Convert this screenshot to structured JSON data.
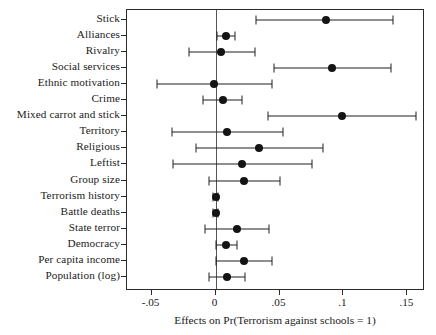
{
  "chart_data": {
    "type": "scatter",
    "title": "",
    "subtitle": "",
    "xlabel": "Effects on Pr(Terrorism against schools = 1)",
    "ylabel": "",
    "xlim": [
      -0.0692,
      0.1637
    ],
    "xticks": [
      -0.05,
      0,
      0.05,
      0.1,
      0.15
    ],
    "xtick_labels": [
      "-.05",
      "0",
      ".05",
      ".1",
      ".15"
    ],
    "grid": false,
    "legend": null,
    "reference_line": 0,
    "orientation": "horizontal",
    "marker": "filled-circle",
    "error_bars": "confidence-interval",
    "categories": [
      "Stick",
      "Alliances",
      "Rivalry",
      "Social services",
      "Ethnic motivation",
      "Crime",
      "Mixed carrot and stick",
      "Territory",
      "Religious",
      "Leftist",
      "Group size",
      "Terrorism history",
      "Battle deaths",
      "State terror",
      "Democracy",
      "Per capita income",
      "Population (log)"
    ],
    "values": [
      0.086,
      0.008,
      0.004,
      0.091,
      -0.001,
      0.006,
      0.099,
      0.009,
      0.034,
      0.021,
      0.022,
      0.0,
      0.0,
      0.017,
      0.008,
      0.022,
      0.009
    ],
    "ci_low": [
      0.032,
      0.001,
      -0.021,
      0.046,
      -0.046,
      -0.01,
      0.041,
      -0.034,
      -0.015,
      -0.033,
      -0.005,
      -0.002,
      -0.002,
      -0.008,
      0.0,
      0.0,
      -0.005
    ],
    "ci_high": [
      0.139,
      0.015,
      0.031,
      0.137,
      0.044,
      0.021,
      0.157,
      0.053,
      0.084,
      0.075,
      0.05,
      0.002,
      0.002,
      0.042,
      0.017,
      0.044,
      0.023
    ]
  }
}
